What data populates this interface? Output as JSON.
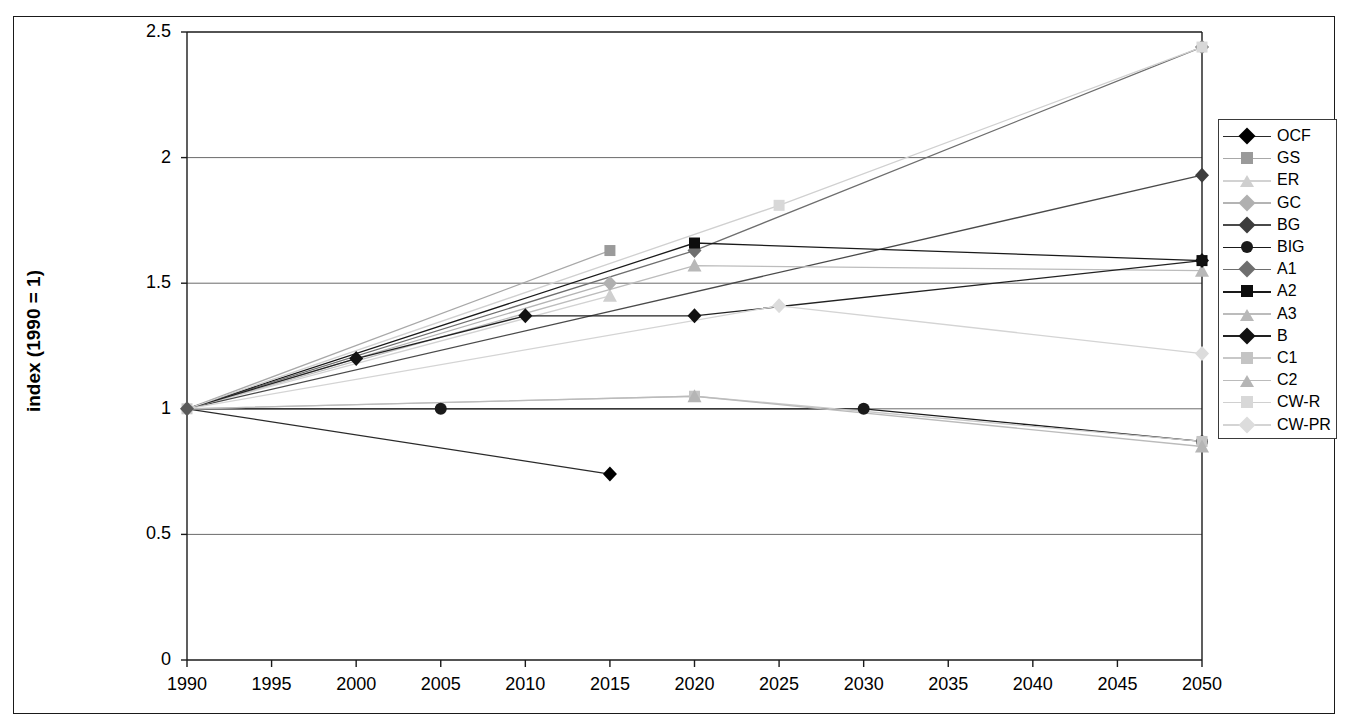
{
  "chart_data": {
    "type": "line",
    "title": "",
    "xlabel": "",
    "ylabel": "index (1990 = 1)",
    "xlim": [
      1990,
      2050
    ],
    "ylim": [
      0,
      2.5
    ],
    "xticks": [
      "1990",
      "1995",
      "2000",
      "2005",
      "2010",
      "2015",
      "2020",
      "2025",
      "2030",
      "2035",
      "2040",
      "2045",
      "2050"
    ],
    "yticks": [
      "0",
      "0.5",
      "1",
      "1.5",
      "2",
      "2.5"
    ],
    "grid": "horizontal",
    "legend_position": "right-outside",
    "series": [
      {
        "name": "OCF",
        "marker": "diamond",
        "color": "#000000",
        "line_color": "#2a2a2a",
        "x": [
          1990,
          2015
        ],
        "y": [
          1.0,
          0.74
        ]
      },
      {
        "name": "GS",
        "marker": "square",
        "color": "#9a9a9a",
        "line_color": "#a8a8a8",
        "x": [
          1990,
          2015
        ],
        "y": [
          1.0,
          1.63
        ]
      },
      {
        "name": "ER",
        "marker": "triangle",
        "color": "#cfcfcf",
        "line_color": "#d2d2d2",
        "x": [
          1990,
          2015
        ],
        "y": [
          1.0,
          1.45
        ]
      },
      {
        "name": "GC",
        "marker": "diamond",
        "color": "#b0b0b0",
        "line_color": "#b4b4b4",
        "x": [
          1990,
          2015
        ],
        "y": [
          1.0,
          1.5
        ]
      },
      {
        "name": "BG",
        "marker": "diamond",
        "color": "#3d3d3d",
        "line_color": "#4a4a4a",
        "x": [
          1990,
          2050
        ],
        "y": [
          1.0,
          1.93
        ]
      },
      {
        "name": "BIG",
        "marker": "circle",
        "color": "#1a1a1a",
        "line_color": "#1a1a1a",
        "x": [
          1990,
          2005,
          2030,
          2050
        ],
        "y": [
          1.0,
          1.0,
          1.0,
          0.87
        ]
      },
      {
        "name": "A1",
        "marker": "diamond",
        "color": "#6e6e6e",
        "line_color": "#6e6e6e",
        "x": [
          1990,
          2020,
          2050
        ],
        "y": [
          1.0,
          1.63,
          2.44
        ]
      },
      {
        "name": "A2",
        "marker": "square",
        "color": "#0d0d0d",
        "line_color": "#1a1a1a",
        "x": [
          1990,
          2020,
          2050
        ],
        "y": [
          1.0,
          1.66,
          1.59
        ]
      },
      {
        "name": "A3",
        "marker": "triangle",
        "color": "#b8b8b8",
        "line_color": "#bcbcbc",
        "x": [
          1990,
          2020,
          2050
        ],
        "y": [
          1.0,
          1.57,
          1.55
        ]
      },
      {
        "name": "B",
        "marker": "diamond",
        "color": "#111111",
        "line_color": "#222222",
        "x": [
          1990,
          2000,
          2010,
          2020,
          2050
        ],
        "y": [
          1.0,
          1.2,
          1.37,
          1.37,
          1.59
        ]
      },
      {
        "name": "C1",
        "marker": "square",
        "color": "#c4c4c4",
        "line_color": "#c8c8c8",
        "x": [
          1990,
          2020,
          2050
        ],
        "y": [
          1.0,
          1.05,
          0.87
        ]
      },
      {
        "name": "C2",
        "marker": "triangle",
        "color": "#b5b5b5",
        "line_color": "#bbbbbb",
        "x": [
          1990,
          2020,
          2050
        ],
        "y": [
          1.0,
          1.05,
          0.85
        ]
      },
      {
        "name": "CW-R",
        "marker": "square",
        "color": "#d8d8d8",
        "line_color": "#d0d0d0",
        "x": [
          1990,
          2025,
          2050
        ],
        "y": [
          1.0,
          1.81,
          2.44
        ]
      },
      {
        "name": "CW-PR",
        "marker": "diamond",
        "color": "#dcdcdc",
        "line_color": "#d4d4d4",
        "x": [
          1990,
          2025,
          2050
        ],
        "y": [
          1.0,
          1.41,
          1.22
        ]
      }
    ]
  },
  "colors": {
    "frame": "#1a1a1a",
    "gridline": "#6b6b6b",
    "axis": "#1a1a1a",
    "background": "#ffffff",
    "legend_border": "#3a3a3a"
  }
}
